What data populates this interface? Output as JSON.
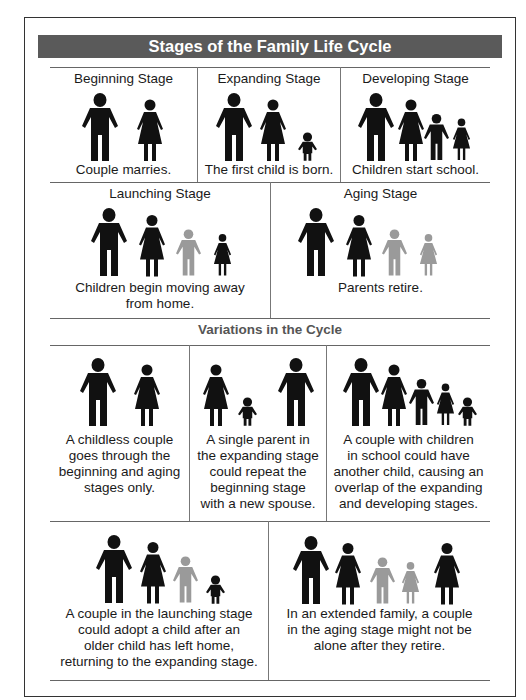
{
  "title": "Stages of the Family Life Cycle",
  "colors": {
    "title_bar": "#5a5a5a",
    "figure_dark": "#111111",
    "figure_gray": "#9a9a9a",
    "subheading": "#555555"
  },
  "stages": [
    {
      "name": "Beginning Stage",
      "caption": "Couple marries.",
      "figures": [
        "man",
        "woman"
      ]
    },
    {
      "name": "Expanding Stage",
      "caption": "The first child is born.",
      "figures": [
        "man",
        "woman",
        "toddler"
      ]
    },
    {
      "name": "Developing Stage",
      "caption": "Children start school.",
      "figures": [
        "man",
        "woman",
        "boy",
        "girl"
      ]
    },
    {
      "name": "Launching Stage",
      "caption_lines": [
        "Children begin moving away",
        "from home."
      ],
      "figures": [
        "man",
        "woman",
        "boy (gray)",
        "girl"
      ]
    },
    {
      "name": "Aging Stage",
      "caption": "Parents retire.",
      "figures": [
        "man",
        "woman",
        "boy (gray)",
        "girl (gray)"
      ]
    }
  ],
  "variations": {
    "heading": "Variations in the Cycle",
    "items": [
      {
        "caption_lines": [
          "A childless couple",
          "goes through the",
          "beginning and aging",
          "stages only."
        ],
        "figures": [
          "man",
          "woman"
        ]
      },
      {
        "caption_lines": [
          "A single parent in",
          "the expanding stage",
          "could repeat the",
          "beginning stage",
          "with a new spouse."
        ],
        "figures": [
          "woman",
          "toddler",
          "man"
        ]
      },
      {
        "caption_lines": [
          "A couple with children",
          "in school could have",
          "another child, causing an",
          "overlap of the expanding",
          "and developing stages."
        ],
        "figures": [
          "man",
          "woman",
          "boy",
          "girl",
          "toddler"
        ]
      },
      {
        "caption_lines": [
          "A couple in the launching stage",
          "could adopt a child after an",
          "older child has left home,",
          "returning to the expanding stage."
        ],
        "figures": [
          "man",
          "woman",
          "boy (gray)",
          "toddler"
        ]
      },
      {
        "caption_lines": [
          "In an extended family, a couple",
          "in the aging stage might not be",
          "alone after they retire."
        ],
        "figures": [
          "man",
          "woman",
          "boy (gray)",
          "girl (gray)",
          "woman"
        ]
      }
    ]
  }
}
